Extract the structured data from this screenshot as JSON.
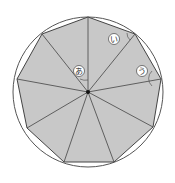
{
  "figure": {
    "type": "regular-nonagon-inscribed-in-circle",
    "sides": 9,
    "center": [
      88,
      92
    ],
    "radius": 75,
    "fill": "#c8c8c8",
    "stroke": "#444444",
    "labels": {
      "a": "あ",
      "i": "い",
      "u": "う"
    }
  }
}
